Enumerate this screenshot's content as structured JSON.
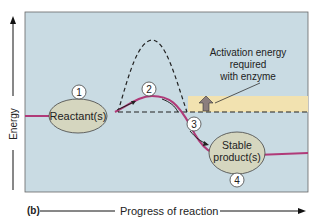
{
  "figure": {
    "panel_label": "(b)",
    "y_axis_label": "Energy",
    "x_axis_label": "Progress of reaction",
    "annotation": [
      "Activation energy",
      "required",
      "with enzyme"
    ],
    "reactant_label": "Reactant(s)",
    "product_label": [
      "Stable",
      "product(s)"
    ],
    "step_numbers": [
      "1",
      "2",
      "3",
      "4"
    ]
  },
  "colors": {
    "plot_background": "#c9dbe3",
    "activation_band": "#f2e2b0",
    "enzyme_curve": "#b03a78",
    "ellipse_fill": "#d5d6bf",
    "arrow_fill": "#8c7e7e"
  }
}
